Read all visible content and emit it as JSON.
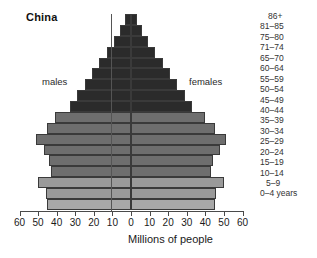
{
  "title": "China",
  "series_labels": {
    "left": "males",
    "right": "females"
  },
  "axis": {
    "title": "Millions of people",
    "tick_labels": [
      "60",
      "50",
      "40",
      "30",
      "20",
      "10",
      "0",
      "10",
      "20",
      "30",
      "40",
      "50",
      "60"
    ],
    "tick_values": [
      -60,
      -50,
      -40,
      -30,
      -20,
      -10,
      0,
      10,
      20,
      30,
      40,
      50,
      60
    ],
    "min": -60,
    "max": 60
  },
  "chart_data": {
    "type": "bar",
    "subtype": "population-pyramid",
    "title": "China",
    "xlabel": "Millions of people",
    "ylabel": "",
    "xlim": [
      -60,
      60
    ],
    "grid": false,
    "legend": "inline",
    "orientation": "horizontal",
    "categories": [
      "86+",
      "81–85",
      "75–80",
      "71–74",
      "65–70",
      "60–64",
      "55–59",
      "50–54",
      "45–49",
      "40–44",
      "35–39",
      "30–34",
      "25–29",
      "20–24",
      "15–19",
      "10–14",
      "5–9",
      "0–4 years"
    ],
    "series": [
      {
        "name": "males",
        "side": "left",
        "values": [
          3,
          6,
          9,
          13,
          17,
          21,
          25,
          29,
          33,
          41,
          45,
          51,
          47,
          44,
          43,
          50,
          46,
          45
        ]
      },
      {
        "name": "females",
        "side": "right",
        "values": [
          3,
          6,
          9,
          13,
          17,
          21,
          25,
          29,
          33,
          40,
          45,
          51,
          48,
          44,
          43,
          50,
          46,
          45
        ]
      }
    ],
    "colors": {
      "dark": "#2b2b2b",
      "mid": "#6e6e6e",
      "light": "#9a9a9a",
      "lighter": "#a8a8a8",
      "outline": "#3a3a3a"
    }
  },
  "bars": [
    {
      "age": "86+",
      "male": 3,
      "female": 3,
      "shade": "dark"
    },
    {
      "age": "81–85",
      "male": 6,
      "female": 6,
      "shade": "dark"
    },
    {
      "age": "75–80",
      "male": 9,
      "female": 9,
      "shade": "dark"
    },
    {
      "age": "71–74",
      "male": 13,
      "female": 13,
      "shade": "dark"
    },
    {
      "age": "65–70",
      "male": 17,
      "female": 17,
      "shade": "dark"
    },
    {
      "age": "60–64",
      "male": 21,
      "female": 21,
      "shade": "dark"
    },
    {
      "age": "55–59",
      "male": 25,
      "female": 25,
      "shade": "dark"
    },
    {
      "age": "50–54",
      "male": 29,
      "female": 29,
      "shade": "dark"
    },
    {
      "age": "45–49",
      "male": 33,
      "female": 33,
      "shade": "dark"
    },
    {
      "age": "40–44",
      "male": 41,
      "female": 40,
      "shade": "mid"
    },
    {
      "age": "35–39",
      "male": 45,
      "female": 45,
      "shade": "mid"
    },
    {
      "age": "30–34",
      "male": 51,
      "female": 51,
      "shade": "mid"
    },
    {
      "age": "25–29",
      "male": 47,
      "female": 48,
      "shade": "mid"
    },
    {
      "age": "20–24",
      "male": 44,
      "female": 44,
      "shade": "mid"
    },
    {
      "age": "15–19",
      "male": 43,
      "female": 43,
      "shade": "mid"
    },
    {
      "age": "10–14",
      "male": 50,
      "female": 50,
      "shade": "light"
    },
    {
      "age": "5–9",
      "male": 46,
      "female": 46,
      "shade": "light"
    },
    {
      "age": "0–4 years",
      "male": 45,
      "female": 45,
      "shade": "lighter"
    }
  ]
}
